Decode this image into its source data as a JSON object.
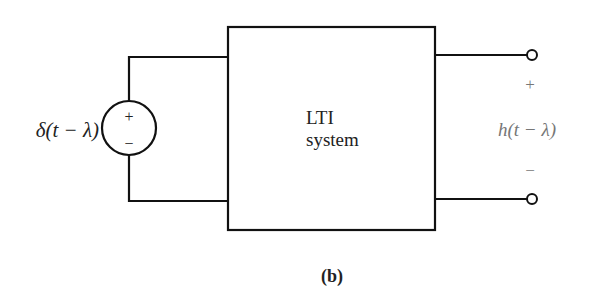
{
  "diagram": {
    "source": {
      "label": "δ(t − λ)",
      "plus": "+",
      "minus": "−"
    },
    "block": {
      "line1": "LTI",
      "line2": "system"
    },
    "output": {
      "label": "h(t − λ)",
      "plus": "+",
      "minus": "−"
    },
    "caption": "(b)"
  }
}
